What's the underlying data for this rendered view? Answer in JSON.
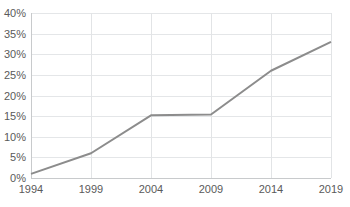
{
  "chart_data": {
    "type": "line",
    "title": "",
    "subtitle": "",
    "xlabel": "",
    "ylabel": "",
    "x": [
      1994,
      1999,
      2004,
      2009,
      2014,
      2019
    ],
    "categories": [
      "1994",
      "1999",
      "2004",
      "2009",
      "2014",
      "2019"
    ],
    "values": [
      1,
      6,
      15.2,
      15.4,
      26,
      33
    ],
    "series": [
      {
        "name": "Share",
        "values": [
          1,
          6,
          15.2,
          15.4,
          26,
          33
        ],
        "color": "#8c8c8c"
      }
    ],
    "xlim": [
      1994,
      2019
    ],
    "ylim": [
      0,
      40
    ],
    "ytick_values": [
      0,
      5,
      10,
      15,
      20,
      25,
      30,
      35,
      40
    ],
    "ytick_labels": [
      "0%",
      "5%",
      "10%",
      "15%",
      "20%",
      "25%",
      "30%",
      "35%",
      "40%"
    ],
    "xtick_labels": [
      "1994",
      "1999",
      "2004",
      "2009",
      "2014",
      "2019"
    ],
    "grid": true,
    "grid_axes": "both",
    "legend": false,
    "legend_position": "none",
    "annotations": [],
    "value_unit": "percent",
    "colors": {
      "line": "#8c8c8c",
      "gridline": "#e4e6e8",
      "axis": "#c8cacc",
      "tick_text": "#5a5a5a",
      "background": "#ffffff"
    }
  },
  "geometry": {
    "plot_left": 31,
    "plot_right": 331,
    "plot_top": 13,
    "plot_bottom": 178,
    "ylabel_x": 26,
    "xlabel_y": 193
  }
}
